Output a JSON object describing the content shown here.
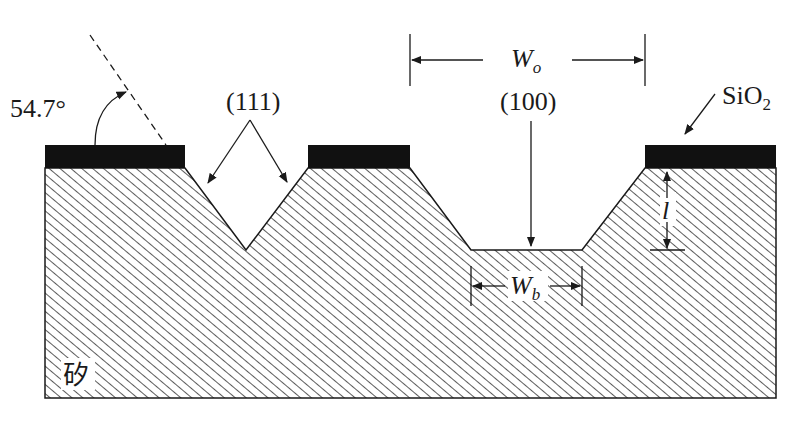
{
  "diagram": {
    "labels": {
      "angle": "54.7°",
      "plane_111": "(111)",
      "plane_100": "(100)",
      "oxide": "SiO",
      "oxide_sub": "2",
      "top_width": "W",
      "top_width_sub": "o",
      "bottom_width": "W",
      "bottom_width_sub": "b",
      "depth": "l",
      "substrate": "矽"
    },
    "colors": {
      "oxide": "#111111",
      "hatch": "#333333",
      "background": "#ffffff",
      "line": "#1a1a1a"
    },
    "geometry": {
      "substrate": {
        "left": 45,
        "right": 776,
        "top": 168,
        "bottom": 398
      },
      "oxide_blocks": [
        {
          "x1": 45,
          "x2": 185
        },
        {
          "x1": 308,
          "x2": 410
        },
        {
          "x1": 645,
          "x2": 776
        }
      ],
      "oxide_top": 145,
      "v_groove": {
        "left": 185,
        "apex_x": 246,
        "apex_y": 250,
        "right": 308
      },
      "trapezoid": {
        "top_left": 410,
        "bottom_left": 471,
        "bottom_right": 582,
        "top_right": 645,
        "bottom_y": 250
      }
    }
  }
}
